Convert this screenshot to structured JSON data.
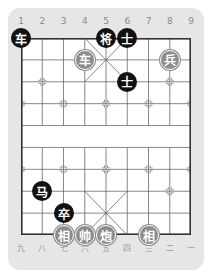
{
  "board": {
    "top_labels": [
      "1",
      "2",
      "3",
      "4",
      "5",
      "6",
      "7",
      "8",
      "9"
    ],
    "bottom_labels": [
      "九",
      "八",
      "七",
      "六",
      "五",
      "四",
      "三",
      "二",
      "一"
    ],
    "colors": {
      "panel": "#e6e6e6",
      "board": "#ffffff",
      "line": "#555555",
      "black_piece": "#111111",
      "red_piece": "#8c8c8c"
    },
    "pieces": [
      {
        "side": "black",
        "char": "车",
        "col": 0,
        "row": 0
      },
      {
        "side": "black",
        "char": "将",
        "col": 4,
        "row": 0
      },
      {
        "side": "black",
        "char": "士",
        "col": 5,
        "row": 0
      },
      {
        "side": "red",
        "char": "车",
        "col": 3,
        "row": 1
      },
      {
        "side": "red",
        "char": "兵",
        "col": 7,
        "row": 1
      },
      {
        "side": "black",
        "char": "士",
        "col": 5,
        "row": 2
      },
      {
        "side": "black",
        "char": "马",
        "col": 1,
        "row": 7
      },
      {
        "side": "black",
        "char": "卒",
        "col": 2,
        "row": 8
      },
      {
        "side": "red",
        "char": "相",
        "col": 2,
        "row": 9
      },
      {
        "side": "red",
        "char": "帅",
        "col": 3,
        "row": 9
      },
      {
        "side": "red",
        "char": "炮",
        "col": 4,
        "row": 9
      },
      {
        "side": "red",
        "char": "相",
        "col": 6,
        "row": 9
      }
    ]
  }
}
